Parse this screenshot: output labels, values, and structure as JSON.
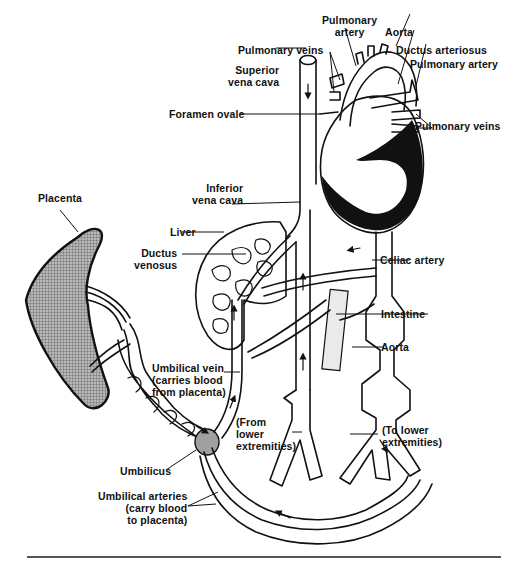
{
  "figure": {
    "labels": {
      "pulmonary_artery_top": "Pulmonary\nartery",
      "aorta_top": "Aorta",
      "pulmonary_veins_left": "Pulmonary veins",
      "ductus_arteriosus": "Ductus arteriosus",
      "pulmonary_artery_right": "Pulmonary artery",
      "superior_vena_cava": "Superior\nvena cava",
      "foramen_ovale": "Foramen ovale",
      "pulmonary_veins_right": "Pulmonary veins",
      "placenta": "Placenta",
      "inferior_vena_cava": "Inferior\nvena cava",
      "liver": "Liver",
      "ductus_venosus": "Ductus\nvenosus",
      "celiac_artery": "Celiac artery",
      "intestine": "Intestine",
      "aorta_abdominal": "Aorta",
      "umbilical_vein": "Umbilical vein\n(carries blood\nfrom placenta)",
      "from_lower_extremities": "(From\nlower\nextremities)",
      "to_lower_extremities": "(To lower\nextremities)",
      "umbilicus": "Umbilicus",
      "umbilical_arteries": "Umbilical arteries\n(carry blood\nto placenta)"
    },
    "colors": {
      "ink": "#111111",
      "placenta_fill": "#8c8c8c",
      "umbilicus_fill": "#a0a0a0",
      "background": "#ffffff"
    }
  }
}
